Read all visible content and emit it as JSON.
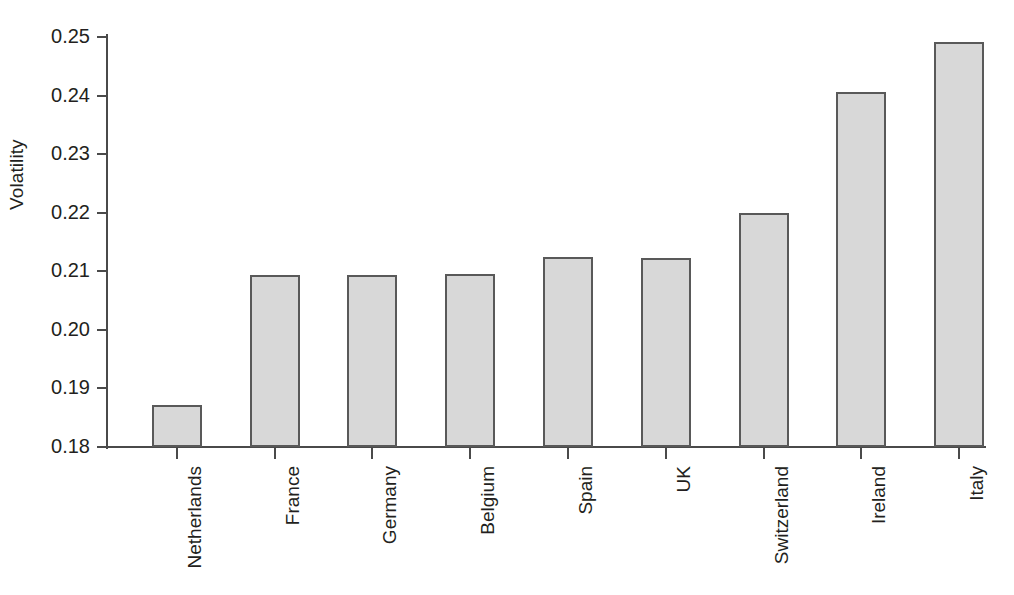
{
  "chart_data": {
    "type": "bar",
    "title": "",
    "subtitle": "",
    "xlabel": "",
    "ylabel": "Volatility",
    "categories": [
      "Netherlands",
      "France",
      "Germany",
      "Belgium",
      "Spain",
      "UK",
      "Switzerland",
      "Ireland",
      "Italy"
    ],
    "values": [
      0.1872,
      0.2094,
      0.2094,
      0.2095,
      0.2124,
      0.2123,
      0.22,
      0.2406,
      0.2491
    ],
    "series": [
      {
        "name": "Volatility",
        "values": [
          0.1872,
          0.2094,
          0.2094,
          0.2095,
          0.2124,
          0.2123,
          0.22,
          0.2406,
          0.2491
        ]
      }
    ],
    "ylim": [
      0.18,
      0.25
    ],
    "yticks": [
      0.18,
      0.19,
      0.2,
      0.21,
      0.22,
      0.23,
      0.24,
      0.25
    ],
    "ytick_labels": [
      "0.18",
      "0.19",
      "0.20",
      "0.21",
      "0.22",
      "0.23",
      "0.24",
      "0.25"
    ],
    "grid": false,
    "legend": "none",
    "bar_fill_color": "#d8d8d8",
    "bar_edge_color": "#595959",
    "axis_color": "#4a4a4a",
    "text_color": "#231f20",
    "background_color": "#ffffff"
  },
  "axis": {
    "y_title": "Volatility"
  }
}
